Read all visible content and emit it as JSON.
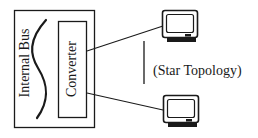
{
  "diagram": {
    "title": "Star Topology",
    "host": {
      "label": "Internal Bus"
    },
    "converter": {
      "label": "Converter"
    },
    "topology_label": "(Star Topology)",
    "nodes": [
      {
        "id": "terminal-top",
        "type": "monitor"
      },
      {
        "id": "terminal-bottom",
        "type": "monitor"
      }
    ],
    "edges": [
      {
        "from": "converter",
        "to": "terminal-top"
      },
      {
        "from": "converter",
        "to": "terminal-bottom"
      }
    ],
    "colors": {
      "stroke": "#1a1a1a",
      "background": "#ffffff"
    }
  }
}
